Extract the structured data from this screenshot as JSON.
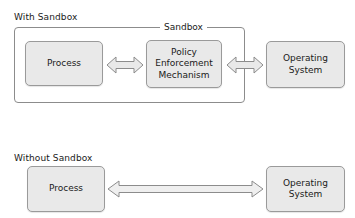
{
  "diagram": {
    "title_top": "With Sandbox",
    "title_bottom": "Without Sandbox",
    "sandbox_label": "Sandbox",
    "colors": {
      "node_fill": "#e9e9e9",
      "node_stroke": "#9a9a9a",
      "container_stroke": "#8c8c8c",
      "arrow_fill": "#e9e9e9",
      "arrow_stroke": "#8c8c8c",
      "text": "#1a1a1a",
      "background": "#ffffff"
    },
    "top_section": {
      "caption": "With Sandbox",
      "container_label": "Sandbox",
      "nodes": [
        {
          "id": "process",
          "label": "Process"
        },
        {
          "id": "policy-enforcement-mechanism",
          "label": "Policy\nEnforcement\nMechanism"
        },
        {
          "id": "operating-system",
          "label": "Operating\nSystem"
        }
      ],
      "connectors": [
        {
          "id": "process-to-pem",
          "from": "process",
          "to": "policy-enforcement-mechanism",
          "kind": "double-arrow"
        },
        {
          "id": "pem-to-os",
          "from": "policy-enforcement-mechanism",
          "to": "operating-system",
          "kind": "double-arrow"
        }
      ]
    },
    "bottom_section": {
      "caption": "Without Sandbox",
      "nodes": [
        {
          "id": "process",
          "label": "Process"
        },
        {
          "id": "operating-system",
          "label": "Operating\nSystem"
        }
      ],
      "connectors": [
        {
          "id": "process-to-os",
          "from": "process",
          "to": "operating-system",
          "kind": "double-arrow"
        }
      ]
    }
  }
}
